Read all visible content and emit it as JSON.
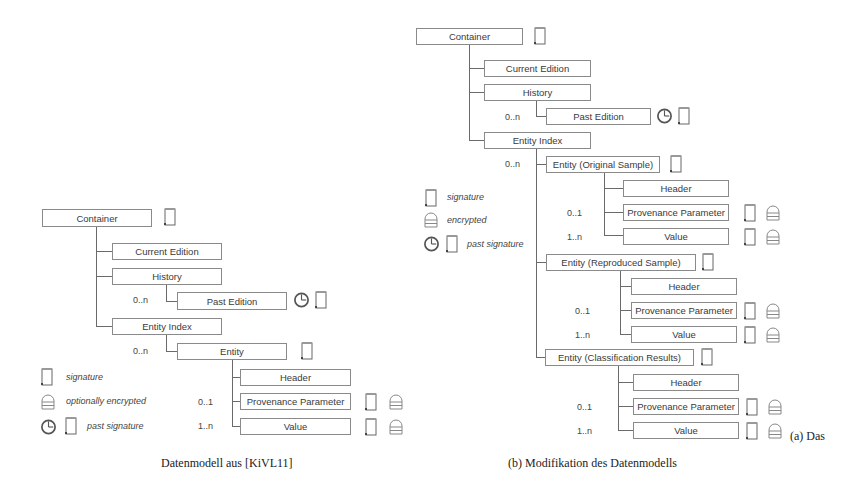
{
  "panel_a": {
    "caption": "Datenmodell aus [KiVL11]",
    "nodes": {
      "container": "Container",
      "current_edition": "Current Edition",
      "history": "History",
      "past_edition": "Past Edition",
      "entity_index": "Entity Index",
      "entity": "Entity",
      "header": "Header",
      "provenance_parameter": "Provenance Parameter",
      "value": "Value"
    },
    "multiplicities": {
      "past_edition": "0..n",
      "entity": "0..n",
      "provenance_parameter": "0..1",
      "value": "1..n"
    },
    "legend": {
      "signature": "signature",
      "encrypted": "optionally encrypted",
      "past_signature": "past signature"
    }
  },
  "panel_b": {
    "caption": "(b) Modifikation des Datenmodells",
    "trailing_caption": "(a) Das",
    "nodes": {
      "container": "Container",
      "current_edition": "Current Edition",
      "history": "History",
      "past_edition": "Past Edition",
      "entity_index": "Entity Index",
      "entity_original": "Entity (Original Sample)",
      "entity_reproduced": "Entity (Reproduced Sample)",
      "entity_classification": "Entity (Classification Results)",
      "header": "Header",
      "provenance_parameter": "Provenance Parameter",
      "value": "Value"
    },
    "multiplicities": {
      "past_edition": "0..n",
      "entity": "0..n",
      "provenance_parameter": "0..1",
      "value": "1..n"
    },
    "legend": {
      "signature": "signature",
      "encrypted": "encrypted",
      "past_signature": "past signature"
    }
  },
  "icons": {
    "signature": "scroll-icon",
    "encrypted": "lock-dome-icon",
    "past_signature": "clock-icon"
  }
}
